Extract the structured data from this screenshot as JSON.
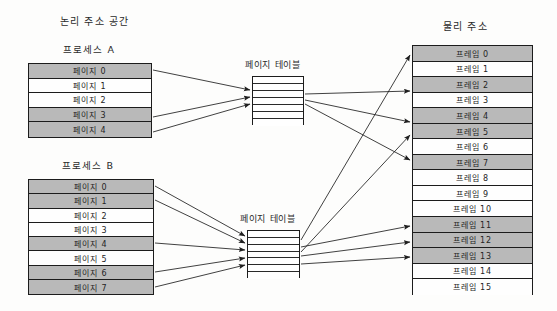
{
  "diagram": {
    "type": "paging-memory-mapping-diagram",
    "headings": {
      "logical_address_space": "논리 주소 공간",
      "physical_address": "물리 주소"
    },
    "processes": [
      {
        "name": "프로세스 A",
        "page_table_label": "페이지 테이블",
        "page_table_rows": 7,
        "pages": [
          {
            "label": "페이지 0",
            "shaded": true
          },
          {
            "label": "페이지 1",
            "shaded": false
          },
          {
            "label": "페이지 2",
            "shaded": false
          },
          {
            "label": "페이지 3",
            "shaded": true
          },
          {
            "label": "페이지 4",
            "shaded": true
          }
        ]
      },
      {
        "name": "프로세스 B",
        "page_table_label": "페이지 테이블",
        "page_table_rows": 7,
        "pages": [
          {
            "label": "페이지 0",
            "shaded": true
          },
          {
            "label": "페이지 1",
            "shaded": true
          },
          {
            "label": "페이지 2",
            "shaded": false
          },
          {
            "label": "페이지 3",
            "shaded": false
          },
          {
            "label": "페이지 4",
            "shaded": true
          },
          {
            "label": "페이지 5",
            "shaded": false
          },
          {
            "label": "페이지 6",
            "shaded": true
          },
          {
            "label": "페이지 7",
            "shaded": true
          }
        ]
      }
    ],
    "frames": [
      {
        "label": "프레임 0",
        "shaded": true
      },
      {
        "label": "프레임 1",
        "shaded": false
      },
      {
        "label": "프레임 2",
        "shaded": true
      },
      {
        "label": "프레임 3",
        "shaded": false
      },
      {
        "label": "프레임 4",
        "shaded": true
      },
      {
        "label": "프레임 5",
        "shaded": true
      },
      {
        "label": "프레임 6",
        "shaded": false
      },
      {
        "label": "프레임 7",
        "shaded": true
      },
      {
        "label": "프레임 8",
        "shaded": false
      },
      {
        "label": "프레임 9",
        "shaded": false
      },
      {
        "label": "프레임 10",
        "shaded": false
      },
      {
        "label": "프레임 11",
        "shaded": true
      },
      {
        "label": "프레임 12",
        "shaded": true
      },
      {
        "label": "프레임 13",
        "shaded": true
      },
      {
        "label": "프레임 14",
        "shaded": false
      },
      {
        "label": "프레임 15",
        "shaded": false
      }
    ],
    "colors": {
      "shaded_fill": "#b9b9b9",
      "unshaded_fill": "#fefefe",
      "stroke": "#1c1c1c",
      "text": "#242424",
      "background": "#fdfdfc"
    },
    "mappings": {
      "process_a_to_page_table": [
        {
          "from_page": 0,
          "to_entry": 1
        },
        {
          "from_page": 3,
          "to_entry": 2
        },
        {
          "from_page": 4,
          "to_entry": 3
        }
      ],
      "process_b_to_page_table": [
        {
          "from_page": 0,
          "to_entry": 0
        },
        {
          "from_page": 1,
          "to_entry": 1
        },
        {
          "from_page": 4,
          "to_entry": 2
        },
        {
          "from_page": 6,
          "to_entry": 3
        },
        {
          "from_page": 7,
          "to_entry": 4
        }
      ],
      "page_table_a_to_frames": [
        2,
        4,
        7
      ],
      "page_table_b_to_frames": [
        0,
        5,
        11,
        12,
        13
      ]
    }
  }
}
